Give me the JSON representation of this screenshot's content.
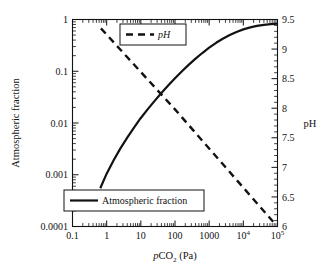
{
  "figure": {
    "background_color": "#ffffff",
    "ink_color": "#121212"
  },
  "chart_data": {
    "type": "line",
    "title": "",
    "xlabel": "pCO2 (Pa)",
    "xlabel_parts": {
      "italic": "p",
      "main": "CO",
      "subscript": "2",
      "units": " (Pa)"
    },
    "ylabel_left": "Atmospheric fraction",
    "ylabel_right": "pH",
    "xscale": "log",
    "xlim": [
      0.1,
      100000
    ],
    "xticks": [
      0.1,
      1,
      10,
      100,
      1000,
      10000,
      100000
    ],
    "xtick_labels": [
      "0.1",
      "1",
      "10",
      "100",
      "1000",
      "10^4",
      "10^5"
    ],
    "yscale_left": "log",
    "ylim_left": [
      0.0001,
      1
    ],
    "yticks_left": [
      0.0001,
      0.001,
      0.01,
      0.1,
      1
    ],
    "ytick_labels_left": [
      "0.0001",
      "0.001",
      "0.01",
      "0.1",
      "1"
    ],
    "yscale_right": "linear",
    "ylim_right": [
      6,
      9.5
    ],
    "yticks_right": [
      6,
      6.5,
      7,
      7.5,
      8,
      8.5,
      9,
      9.5
    ],
    "ytick_labels_right": [
      "6",
      "6.5",
      "7",
      "7.5",
      "8",
      "8.5",
      "9",
      "9.5"
    ],
    "ytick_minor_right_step": 0.1,
    "grid": false,
    "series": [
      {
        "name": "Atmospheric fraction",
        "axis": "left",
        "style": "solid",
        "linewidth": 2.2,
        "color": "#121212",
        "points": [
          [
            0.65,
            0.00055
          ],
          [
            1.0,
            0.00105
          ],
          [
            1.6,
            0.0019
          ],
          [
            2.5,
            0.0032
          ],
          [
            4.0,
            0.0052
          ],
          [
            6.3,
            0.0081
          ],
          [
            10.0,
            0.0125
          ],
          [
            16.0,
            0.0185
          ],
          [
            25.0,
            0.0265
          ],
          [
            40.0,
            0.038
          ],
          [
            63.0,
            0.053
          ],
          [
            100.0,
            0.073
          ],
          [
            160.0,
            0.1
          ],
          [
            250.0,
            0.133
          ],
          [
            400.0,
            0.175
          ],
          [
            630.0,
            0.225
          ],
          [
            1000.0,
            0.285
          ],
          [
            1600.0,
            0.355
          ],
          [
            2500.0,
            0.425
          ],
          [
            4000.0,
            0.5
          ],
          [
            6300.0,
            0.575
          ],
          [
            10000.0,
            0.645
          ],
          [
            16000.0,
            0.705
          ],
          [
            25000.0,
            0.752
          ],
          [
            40000.0,
            0.79
          ],
          [
            63000.0,
            0.815
          ],
          [
            100000.0,
            0.83
          ]
        ]
      },
      {
        "name": "pH",
        "axis": "right",
        "style": "dashed",
        "linewidth": 2.4,
        "dash_pattern": "7,5",
        "color": "#121212",
        "points": [
          [
            0.68,
            9.35
          ],
          [
            100.0,
            7.98
          ],
          [
            80000.0,
            6.06
          ]
        ]
      }
    ],
    "legends": [
      {
        "name": "pH",
        "label": "pH",
        "style": "dashed",
        "italic": true,
        "x": 120,
        "y": 24,
        "width": 66,
        "height": 21
      },
      {
        "name": "Atmospheric fraction",
        "label": "Atmospheric fraction",
        "style": "solid",
        "italic": false,
        "x": 64,
        "y": 190,
        "width": 140,
        "height": 21
      }
    ],
    "annotations": [
      {
        "name": "curve-crossing",
        "pco2": 100,
        "fraction": 0.02,
        "ph": 8.0
      }
    ]
  }
}
